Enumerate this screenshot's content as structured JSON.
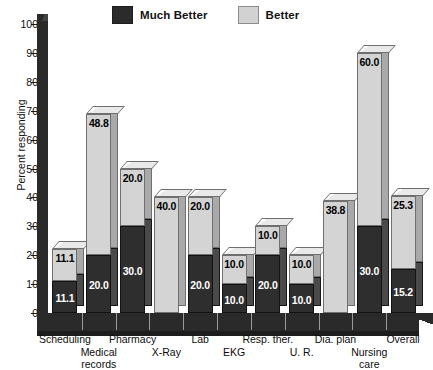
{
  "chart_data": {
    "type": "bar",
    "subtype": "stacked-3d-column",
    "title": "",
    "xlabel": "",
    "ylabel": "Percent responding",
    "ylim": [
      0,
      100
    ],
    "yticks": [
      0,
      10,
      20,
      30,
      40,
      50,
      60,
      70,
      80,
      90,
      100
    ],
    "grid": false,
    "legend_position": "top",
    "categories": [
      "Scheduling",
      "Medical records",
      "Pharmacy",
      "X-Ray",
      "Lab",
      "EKG",
      "Resp. ther.",
      "U. R.",
      "Dia. plan",
      "Nursing care",
      "Overall"
    ],
    "series": [
      {
        "name": "Much Better",
        "color": "#2e2e2e",
        "values": [
          11.1,
          20.0,
          30.0,
          0.0,
          20.0,
          10.0,
          20.0,
          10.0,
          0.0,
          30.0,
          15.2
        ],
        "labels": [
          "11.1",
          "20.0",
          "30.0",
          "",
          "20.0",
          "10.0",
          "20.0",
          "10.0",
          "",
          "30.0",
          "15.2"
        ]
      },
      {
        "name": "Better",
        "color": "#d4d4d4",
        "values": [
          11.1,
          48.8,
          20.0,
          40.0,
          20.0,
          10.0,
          10.0,
          10.0,
          38.8,
          60.0,
          25.3
        ],
        "labels": [
          "11.1",
          "48.8",
          "20.0",
          "40.0",
          "20.0",
          "10.0",
          "10.0",
          "10.0",
          "38.8",
          "60.0",
          "25.3"
        ]
      }
    ],
    "totals": [
      22.2,
      68.8,
      50.0,
      40.0,
      40.0,
      20.0,
      30.0,
      20.0,
      38.8,
      90.0,
      40.5
    ]
  },
  "legend": {
    "entries": [
      {
        "label": "Much Better",
        "swatch": "dark"
      },
      {
        "label": "Better",
        "swatch": "light"
      }
    ]
  },
  "axis": {
    "y_title": "Percent responding",
    "y_ticks": [
      "0",
      "10",
      "20",
      "30",
      "40",
      "50",
      "60",
      "70",
      "80",
      "90",
      "100"
    ]
  },
  "x_labels": [
    {
      "text": "Scheduling",
      "row": 0
    },
    {
      "text": "Medical",
      "text2": "records",
      "row": 1
    },
    {
      "text": "Pharmacy",
      "row": 0
    },
    {
      "text": "X-Ray",
      "row": 1
    },
    {
      "text": "Lab",
      "row": 0
    },
    {
      "text": "EKG",
      "row": 1
    },
    {
      "text": "Resp. ther.",
      "row": 0
    },
    {
      "text": "U. R.",
      "row": 1
    },
    {
      "text": "Dia. plan",
      "row": 0
    },
    {
      "text": "Nursing",
      "text2": "care",
      "row": 1
    },
    {
      "text": "Overall",
      "row": 0
    }
  ]
}
